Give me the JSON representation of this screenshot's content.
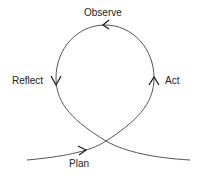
{
  "diagram": {
    "type": "action-research-cycle",
    "stroke_color": "#555555",
    "text_color": "#222222",
    "stages": [
      {
        "label": "Observe",
        "position": "top"
      },
      {
        "label": "Reflect",
        "position": "left"
      },
      {
        "label": "Act",
        "position": "right"
      },
      {
        "label": "Plan",
        "position": "bottom"
      }
    ]
  }
}
